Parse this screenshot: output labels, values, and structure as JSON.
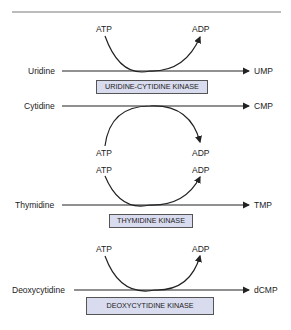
{
  "diagram": {
    "reactions": [
      {
        "substrate": "Uridine",
        "product": "UMP",
        "enzyme": "URIDINE-CYTIDINE KINASE",
        "cofactor_in": "ATP",
        "cofactor_out": "ADP"
      },
      {
        "substrate": "Cytidine",
        "product": "CMP",
        "enzyme": "URIDINE-CYTIDINE KINASE",
        "cofactor_in": "ATP",
        "cofactor_out": "ADP"
      },
      {
        "substrate": "Thymidine",
        "product": "TMP",
        "enzyme": "THYMIDINE KINASE",
        "cofactor_in": "ATP",
        "cofactor_out": "ADP"
      },
      {
        "substrate": "Deoxycytidine",
        "product": "dCMP",
        "enzyme": "DEOXYCYTIDINE KINASE",
        "cofactor_in": "ATP",
        "cofactor_out": "ADP"
      }
    ],
    "colors": {
      "enzyme_box_fill": "#d9dbee",
      "line": "#222222"
    }
  }
}
